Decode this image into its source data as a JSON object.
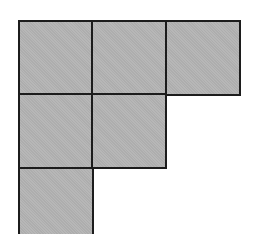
{
  "diagram": {
    "type": "young-diagram",
    "partition": [
      3,
      2,
      1
    ],
    "origin": {
      "x": 19,
      "y": 21
    },
    "cell_size": 73.5,
    "colors": {
      "fill": "#b3b3b3",
      "border": "#1c1c1c",
      "background": "#ffffff"
    },
    "cells": [
      {
        "row": 0,
        "col": 0
      },
      {
        "row": 0,
        "col": 1
      },
      {
        "row": 0,
        "col": 2
      },
      {
        "row": 1,
        "col": 0
      },
      {
        "row": 1,
        "col": 1
      },
      {
        "row": 2,
        "col": 0
      }
    ]
  }
}
